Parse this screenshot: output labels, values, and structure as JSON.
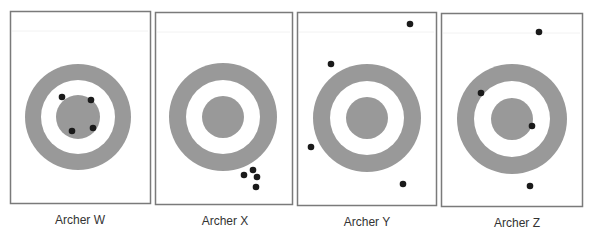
{
  "colors": {
    "ring": "#999999",
    "dot": "#1a1a1a",
    "frame": "#7a7a7a",
    "background": "#ffffff"
  },
  "panels": [
    {
      "label": "Archer W",
      "frame": {
        "x": 10,
        "y": 11,
        "w": 140,
        "h": 192
      },
      "target": {
        "cx": 78,
        "cy": 117,
        "outer_r": 53,
        "white_r": 37,
        "inner_r": 22
      },
      "arrows": [
        [
          62,
          97
        ],
        [
          91,
          100
        ],
        [
          72,
          131
        ],
        [
          93,
          128
        ]
      ],
      "label_pos": {
        "x": 80,
        "y": 213
      }
    },
    {
      "label": "Archer X",
      "frame": {
        "x": 155,
        "y": 12,
        "w": 137,
        "h": 192
      },
      "target": {
        "cx": 223,
        "cy": 117,
        "outer_r": 54,
        "white_r": 37,
        "inner_r": 21
      },
      "arrows": [
        [
          244,
          175
        ],
        [
          253,
          170
        ],
        [
          257,
          177
        ],
        [
          256,
          187
        ]
      ],
      "label_pos": {
        "x": 225,
        "y": 214
      }
    },
    {
      "label": "Archer Y",
      "frame": {
        "x": 297,
        "y": 12,
        "w": 139,
        "h": 193
      },
      "target": {
        "cx": 367,
        "cy": 118,
        "outer_r": 54,
        "white_r": 37,
        "inner_r": 21
      },
      "arrows": [
        [
          410,
          24
        ],
        [
          331,
          64
        ],
        [
          311,
          147
        ],
        [
          403,
          184
        ]
      ],
      "label_pos": {
        "x": 367,
        "y": 215
      }
    },
    {
      "label": "Archer Z",
      "frame": {
        "x": 441,
        "y": 13,
        "w": 141,
        "h": 193
      },
      "target": {
        "cx": 512,
        "cy": 119,
        "outer_r": 55,
        "white_r": 38,
        "inner_r": 21
      },
      "arrows": [
        [
          539,
          32
        ],
        [
          481,
          93
        ],
        [
          532,
          126
        ],
        [
          530,
          186
        ]
      ],
      "label_pos": {
        "x": 517,
        "y": 216
      }
    }
  ]
}
